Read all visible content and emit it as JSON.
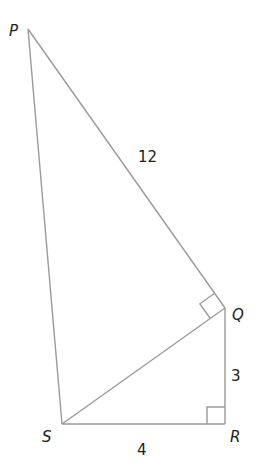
{
  "diagram": {
    "vertices": {
      "P": {
        "label": "P",
        "x": 28,
        "y": 29
      },
      "Q": {
        "label": "Q",
        "x": 225,
        "y": 308
      },
      "R": {
        "label": "R",
        "x": 225,
        "y": 424
      },
      "S": {
        "label": "S",
        "x": 62,
        "y": 424
      }
    },
    "edges": [
      {
        "from": "P",
        "to": "Q",
        "label": "12"
      },
      {
        "from": "Q",
        "to": "R",
        "label": "3"
      },
      {
        "from": "S",
        "to": "R",
        "label": "4"
      },
      {
        "from": "P",
        "to": "S",
        "label": ""
      },
      {
        "from": "S",
        "to": "Q",
        "label": ""
      }
    ],
    "right_angles": [
      "PQS",
      "QRS"
    ],
    "labels": {
      "P": "P",
      "Q": "Q",
      "R": "R",
      "S": "S",
      "PQ": "12",
      "QR": "3",
      "SR": "4"
    },
    "line_color": "#9a9a9a"
  }
}
